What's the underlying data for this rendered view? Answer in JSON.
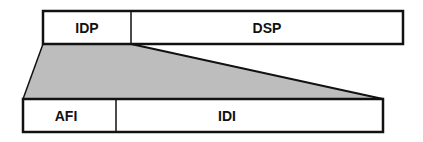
{
  "diagram": {
    "top_box": {
      "fields": [
        {
          "label": "IDP"
        },
        {
          "label": "DSP"
        }
      ]
    },
    "bottom_box": {
      "fields": [
        {
          "label": "AFI"
        },
        {
          "label": "IDI"
        }
      ]
    },
    "colors": {
      "stroke": "#111111",
      "fill": "#ffffff",
      "expansion_fill": "#bdbdbd"
    }
  }
}
